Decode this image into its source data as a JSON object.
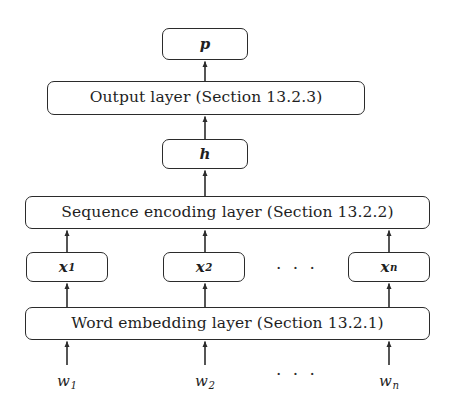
{
  "diagram": {
    "background_color": "#ffffff",
    "stroke_color": "#2b2b2b",
    "text_color": "#1f1f1f",
    "nodes": {
      "p": {
        "label": "p",
        "sub": ""
      },
      "output_layer": {
        "label": "Output layer (Section 13.2.3)"
      },
      "h": {
        "label": "h",
        "sub": ""
      },
      "sequence_encoding_layer": {
        "label": "Sequence encoding layer (Section 13.2.2)"
      },
      "x1": {
        "label": "x",
        "sub": "1"
      },
      "x2": {
        "label": "x",
        "sub": "2"
      },
      "xn": {
        "label": "x",
        "sub": "n"
      },
      "word_embedding_layer": {
        "label": "Word embedding layer (Section 13.2.1)"
      },
      "w1": {
        "label": "w",
        "sub": "1"
      },
      "w2": {
        "label": "w",
        "sub": "2"
      },
      "wn": {
        "label": "w",
        "sub": "n"
      }
    },
    "ellipsis": {
      "embeddings_row": "· · ·",
      "tokens_row": "· · ·"
    },
    "edges": [
      {
        "from": "w1",
        "to": "word_embedding_layer"
      },
      {
        "from": "w2",
        "to": "word_embedding_layer"
      },
      {
        "from": "wn",
        "to": "word_embedding_layer"
      },
      {
        "from": "word_embedding_layer",
        "to": "x1"
      },
      {
        "from": "word_embedding_layer",
        "to": "x2"
      },
      {
        "from": "word_embedding_layer",
        "to": "xn"
      },
      {
        "from": "x1",
        "to": "sequence_encoding_layer"
      },
      {
        "from": "x2",
        "to": "sequence_encoding_layer"
      },
      {
        "from": "xn",
        "to": "sequence_encoding_layer"
      },
      {
        "from": "sequence_encoding_layer",
        "to": "h"
      },
      {
        "from": "h",
        "to": "output_layer"
      },
      {
        "from": "output_layer",
        "to": "p"
      }
    ]
  }
}
